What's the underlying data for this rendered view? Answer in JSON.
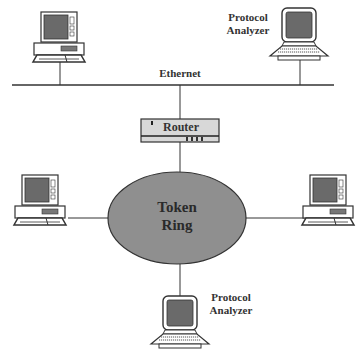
{
  "diagram": {
    "backbone_label": "Ethernet",
    "router_label": "Router",
    "ring_label_line1": "Token",
    "ring_label_line2": "Ring",
    "analyzer_top_line1": "Protocol",
    "analyzer_top_line2": "Analyzer",
    "analyzer_bottom_line1": "Protocol",
    "analyzer_bottom_line2": "Analyzer",
    "nodes": [
      {
        "id": "ethernet-desktop",
        "type": "desktop-computer",
        "network": "Ethernet"
      },
      {
        "id": "ethernet-analyzer",
        "type": "protocol-analyzer-laptop",
        "network": "Ethernet"
      },
      {
        "id": "router",
        "type": "router",
        "connects": [
          "Ethernet",
          "Token Ring"
        ]
      },
      {
        "id": "ring-left-desktop",
        "type": "desktop-computer",
        "network": "Token Ring"
      },
      {
        "id": "ring-right-desktop",
        "type": "desktop-computer",
        "network": "Token Ring"
      },
      {
        "id": "ring-analyzer",
        "type": "protocol-analyzer-laptop",
        "network": "Token Ring"
      }
    ],
    "colors": {
      "ring_fill": "#8f8f8f",
      "screen_fill": "#6a6a6a",
      "line": "#333333"
    }
  }
}
